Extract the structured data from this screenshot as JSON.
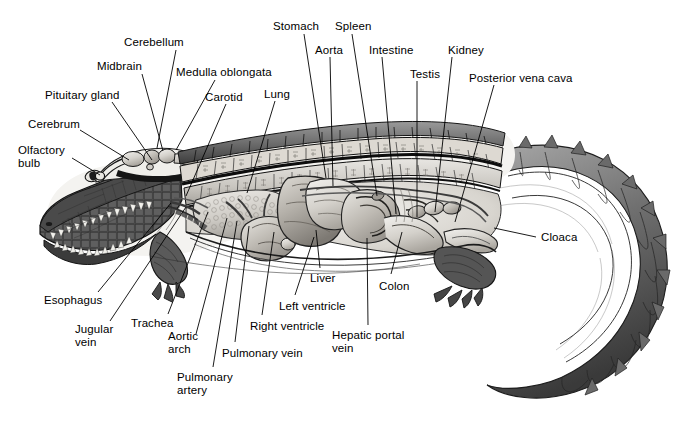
{
  "figure": {
    "view": "lateral cutaway",
    "background_color": "#ffffff",
    "line_color": "#000000",
    "text_color": "#000000",
    "width": 694,
    "height": 422
  },
  "labels": [
    {
      "id": "cerebellum",
      "text": "Cerebellum",
      "x": 124,
      "y": 36,
      "align": "left",
      "leader": [
        [
          176,
          50
        ],
        [
          157,
          148
        ]
      ]
    },
    {
      "id": "midbrain",
      "text": "Midbrain",
      "x": 97,
      "y": 60,
      "align": "left",
      "leader": [
        [
          142,
          74
        ],
        [
          163,
          151
        ]
      ]
    },
    {
      "id": "medulla-oblongata",
      "text": "Medulla oblongata",
      "x": 176,
      "y": 66,
      "align": "left",
      "leader": [
        [
          215,
          80
        ],
        [
          176,
          150
        ]
      ]
    },
    {
      "id": "pituitary-gland",
      "text": "Pituitary gland",
      "x": 45,
      "y": 89,
      "align": "left",
      "leader": [
        [
          112,
          102
        ],
        [
          152,
          160
        ]
      ]
    },
    {
      "id": "carotid",
      "text": "Carotid",
      "x": 205,
      "y": 91,
      "align": "left",
      "leader": [
        [
          226,
          104
        ],
        [
          186,
          196
        ]
      ]
    },
    {
      "id": "lung",
      "text": "Lung",
      "x": 264,
      "y": 88,
      "align": "left",
      "leader": [
        [
          275,
          101
        ],
        [
          247,
          193
        ]
      ]
    },
    {
      "id": "cerebrum",
      "text": "Cerebrum",
      "x": 28,
      "y": 118,
      "align": "left",
      "leader": [
        [
          80,
          130
        ],
        [
          129,
          160
        ]
      ]
    },
    {
      "id": "olfactory-bulb",
      "text": "Olfactory\nbulb",
      "x": 18,
      "y": 144,
      "align": "left",
      "leader": [
        [
          72,
          158
        ],
        [
          100,
          175
        ]
      ]
    },
    {
      "id": "stomach",
      "text": "Stomach",
      "x": 273,
      "y": 20,
      "align": "left",
      "leader": [
        [
          304,
          34
        ],
        [
          326,
          178
        ]
      ]
    },
    {
      "id": "aorta",
      "text": "Aorta",
      "x": 315,
      "y": 44,
      "align": "left",
      "leader": [
        [
          330,
          57
        ],
        [
          333,
          186
        ]
      ]
    },
    {
      "id": "spleen",
      "text": "Spleen",
      "x": 335,
      "y": 20,
      "align": "left",
      "leader": [
        [
          352,
          34
        ],
        [
          377,
          196
        ]
      ]
    },
    {
      "id": "intestine",
      "text": "Intestine",
      "x": 369,
      "y": 44,
      "align": "left",
      "leader": [
        [
          382,
          57
        ],
        [
          396,
          214
        ]
      ]
    },
    {
      "id": "testis",
      "text": "Testis",
      "x": 410,
      "y": 68,
      "align": "left",
      "leader": [
        [
          417,
          81
        ],
        [
          417,
          217
        ]
      ]
    },
    {
      "id": "kidney",
      "text": "Kidney",
      "x": 448,
      "y": 44,
      "align": "left",
      "leader": [
        [
          452,
          57
        ],
        [
          435,
          212
        ]
      ]
    },
    {
      "id": "posterior-vena-cava",
      "text": "Posterior vena cava",
      "x": 469,
      "y": 72,
      "align": "left",
      "leader": [
        [
          494,
          85
        ],
        [
          455,
          222
        ]
      ]
    },
    {
      "id": "cloaca",
      "text": "Cloaca",
      "x": 541,
      "y": 231,
      "align": "left",
      "leader": [
        [
          536,
          237
        ],
        [
          494,
          228
        ]
      ]
    },
    {
      "id": "liver",
      "text": "Liver",
      "x": 310,
      "y": 272,
      "align": "left",
      "leader": [
        [
          320,
          268
        ],
        [
          316,
          230
        ]
      ]
    },
    {
      "id": "colon",
      "text": "Colon",
      "x": 379,
      "y": 280,
      "align": "left",
      "leader": [
        [
          391,
          274
        ],
        [
          402,
          232
        ]
      ]
    },
    {
      "id": "hepatic-portal-vein",
      "text": "Hepatic portal\nvein",
      "x": 332,
      "y": 329,
      "align": "left",
      "leader": [
        [
          368,
          325
        ],
        [
          367,
          238
        ]
      ]
    },
    {
      "id": "left-ventricle",
      "text": "Left ventricle",
      "x": 279,
      "y": 300,
      "align": "left",
      "leader": [
        [
          295,
          295
        ],
        [
          314,
          237
        ]
      ]
    },
    {
      "id": "right-ventricle",
      "text": "Right ventricle",
      "x": 250,
      "y": 320,
      "align": "left",
      "leader": [
        [
          262,
          315
        ],
        [
          274,
          232
        ]
      ]
    },
    {
      "id": "pulmonary-vein",
      "text": "Pulmonary vein",
      "x": 222,
      "y": 347,
      "align": "left",
      "leader": [
        [
          235,
          342
        ],
        [
          249,
          226
        ]
      ]
    },
    {
      "id": "pulmonary-artery",
      "text": "Pulmonary\nartery",
      "x": 177,
      "y": 371,
      "align": "left",
      "leader": [
        [
          213,
          367
        ],
        [
          237,
          221
        ]
      ]
    },
    {
      "id": "aortic-arch",
      "text": "Aortic\narch",
      "x": 168,
      "y": 330,
      "align": "left",
      "leader": [
        [
          196,
          334
        ],
        [
          227,
          218
        ]
      ]
    },
    {
      "id": "trachea",
      "text": "Trachea",
      "x": 131,
      "y": 317,
      "align": "left",
      "leader": [
        [
          168,
          314
        ],
        [
          208,
          212
        ]
      ]
    },
    {
      "id": "jugular-vein",
      "text": "Jugular\nvein",
      "x": 75,
      "y": 323,
      "align": "left",
      "leader": [
        [
          110,
          321
        ],
        [
          186,
          207
        ]
      ]
    },
    {
      "id": "esophagus",
      "text": "Esophagus",
      "x": 44,
      "y": 294,
      "align": "left",
      "leader": [
        [
          98,
          292
        ],
        [
          171,
          203
        ]
      ]
    }
  ],
  "anatomy_regions": [
    {
      "id": "head",
      "name": "head-and-snout"
    },
    {
      "id": "brain-cavity",
      "name": "brain-cavity"
    },
    {
      "id": "dorsal-scutes",
      "name": "dorsal-osteoderm-rows"
    },
    {
      "id": "lung-region",
      "name": "lung"
    },
    {
      "id": "heart-region",
      "name": "heart"
    },
    {
      "id": "liver-region",
      "name": "liver"
    },
    {
      "id": "stomach-region",
      "name": "stomach"
    },
    {
      "id": "intestine-coils",
      "name": "intestinal-coils"
    },
    {
      "id": "kidney-region",
      "name": "kidneys"
    },
    {
      "id": "forelimb",
      "name": "forelimb"
    },
    {
      "id": "hindlimb",
      "name": "hindlimb"
    },
    {
      "id": "tail",
      "name": "curved-tail"
    }
  ]
}
